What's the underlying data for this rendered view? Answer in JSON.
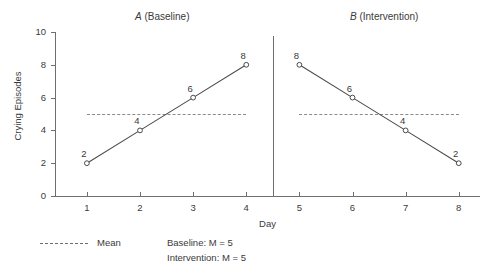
{
  "chart_data": {
    "type": "line",
    "title": "",
    "xlabel": "Day",
    "ylabel": "Crying Episodes",
    "xlim": [
      0.4,
      8.4
    ],
    "ylim": [
      0,
      10
    ],
    "x_ticks": [
      1,
      2,
      3,
      4,
      5,
      6,
      7,
      8
    ],
    "x_tick_labels": [
      "1",
      "2",
      "3",
      "4",
      "5",
      "6",
      "7",
      "8"
    ],
    "y_ticks": [
      0,
      2,
      4,
      6,
      8,
      10
    ],
    "y_tick_labels": [
      "0",
      "2",
      "4",
      "6",
      "8",
      "10"
    ],
    "grid": false,
    "legend_position": "below-left",
    "phase_divider_x": 4.5,
    "series": [
      {
        "name": "A (Baseline)",
        "phase_letter": "A",
        "phase_name": "(Baseline)",
        "x": [
          1,
          2,
          3,
          4
        ],
        "values": [
          2,
          4,
          6,
          8
        ],
        "point_labels": [
          "2",
          "4",
          "6",
          "8"
        ],
        "mean": 5,
        "mean_label": "Baseline: M = 5"
      },
      {
        "name": "B (Intervention)",
        "phase_letter": "B",
        "phase_name": "(Intervention)",
        "x": [
          5,
          6,
          7,
          8
        ],
        "values": [
          8,
          6,
          4,
          2
        ],
        "point_labels": [
          "8",
          "6",
          "4",
          "2"
        ],
        "mean": 5,
        "mean_label": "Intervention: M = 5"
      }
    ],
    "annotations": [],
    "colors": {
      "line": "#4a4a4a",
      "axis": "#6e6e6e",
      "mean": "#8a8a8a",
      "text": "#3a3a3a",
      "background": "#ffffff"
    }
  },
  "legend": {
    "mean_label": "Mean",
    "stats": [
      "Baseline: M = 5",
      "Intervention: M = 5"
    ]
  }
}
